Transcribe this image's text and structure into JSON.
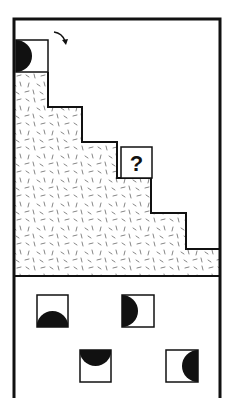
{
  "puzzle": {
    "question_label": "?",
    "rotation_arrow": "clockwise-arrow",
    "start_tile": {
      "disc_side": "left"
    },
    "colors": {
      "ink": "#111111",
      "paper": "#ffffff",
      "speckle": "#666666"
    }
  },
  "options": [
    {
      "id": "A",
      "disc_side": "bottom"
    },
    {
      "id": "B",
      "disc_side": "left"
    },
    {
      "id": "C",
      "disc_side": "top"
    },
    {
      "id": "D",
      "disc_side": "right"
    }
  ]
}
